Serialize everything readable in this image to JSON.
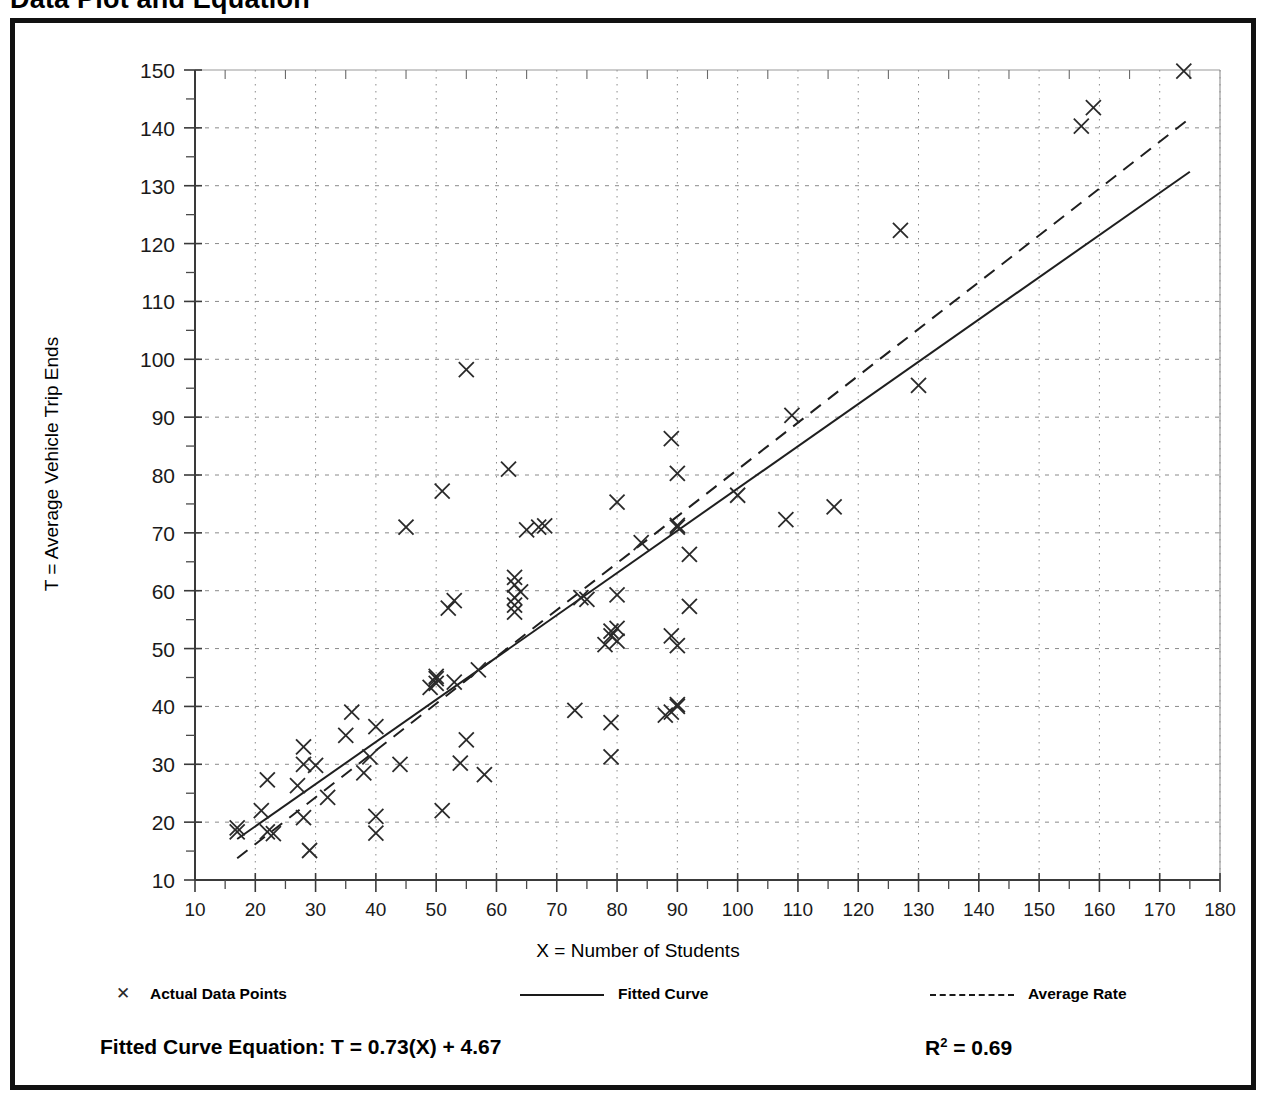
{
  "page": {
    "title": "Data Plot and Equation"
  },
  "chart_data": {
    "type": "scatter",
    "title": "Data Plot and Equation",
    "xlabel": "X = Number of Students",
    "ylabel": "T = Average Vehicle Trip Ends",
    "xlim": [
      10,
      180
    ],
    "ylim": [
      10,
      150
    ],
    "xticks": [
      10,
      20,
      30,
      40,
      50,
      60,
      70,
      80,
      90,
      100,
      110,
      120,
      130,
      140,
      150,
      160,
      170,
      180
    ],
    "yticks": [
      10,
      20,
      30,
      40,
      50,
      60,
      70,
      80,
      90,
      100,
      110,
      120,
      130,
      140,
      150
    ],
    "xtick_labels": [
      "10",
      "20",
      "30",
      "40",
      "50",
      "60",
      "70",
      "80",
      "90",
      "100",
      "110",
      "120",
      "130",
      "140",
      "150",
      "160",
      "170",
      "180"
    ],
    "ytick_labels": [
      "10",
      "20",
      "30",
      "40",
      "50",
      "60",
      "70",
      "80",
      "90",
      "100",
      "110",
      "120",
      "130",
      "140",
      "150"
    ],
    "minor_tick_step": 5,
    "grid": true,
    "grid_style": "dotted",
    "legend_position": "below-axes",
    "marker": "x",
    "series": [
      {
        "name": "Actual Data Points",
        "type": "scatter",
        "marker": "x",
        "points": [
          [
            17,
            19.0
          ],
          [
            17,
            18.3
          ],
          [
            21,
            22.0
          ],
          [
            22,
            27.3
          ],
          [
            22,
            18.3
          ],
          [
            23,
            18.0
          ],
          [
            27,
            26.3
          ],
          [
            28,
            20.8
          ],
          [
            28,
            30.0
          ],
          [
            28,
            33.0
          ],
          [
            29,
            15.1
          ],
          [
            30,
            29.8
          ],
          [
            32,
            24.3
          ],
          [
            35,
            35.0
          ],
          [
            36,
            39.0
          ],
          [
            38,
            28.5
          ],
          [
            39,
            31.3
          ],
          [
            40,
            36.5
          ],
          [
            40,
            21.0
          ],
          [
            40,
            18.1
          ],
          [
            44,
            30.0
          ],
          [
            45,
            71.0
          ],
          [
            49,
            43.3
          ],
          [
            50,
            45.2
          ],
          [
            50,
            44.8
          ],
          [
            50,
            44.0
          ],
          [
            51,
            77.2
          ],
          [
            51,
            22.0
          ],
          [
            52,
            57.0
          ],
          [
            53,
            58.3
          ],
          [
            53,
            44.2
          ],
          [
            54,
            30.2
          ],
          [
            55,
            98.2
          ],
          [
            55,
            34.2
          ],
          [
            57,
            46.3
          ],
          [
            58,
            28.2
          ],
          [
            62,
            81.0
          ],
          [
            63,
            61.0
          ],
          [
            63,
            58.8
          ],
          [
            63,
            62.3
          ],
          [
            63,
            57.5
          ],
          [
            63,
            56.3
          ],
          [
            64,
            59.8
          ],
          [
            65,
            70.5
          ],
          [
            67,
            71.0
          ],
          [
            68,
            71.2
          ],
          [
            73,
            39.3
          ],
          [
            74,
            58.8
          ],
          [
            75,
            58.5
          ],
          [
            78,
            50.7
          ],
          [
            79,
            52.2
          ],
          [
            79,
            53.0
          ],
          [
            79,
            31.3
          ],
          [
            79,
            37.2
          ],
          [
            80,
            75.3
          ],
          [
            80,
            59.3
          ],
          [
            80,
            53.5
          ],
          [
            80,
            51.3
          ],
          [
            84,
            68.3
          ],
          [
            88,
            38.5
          ],
          [
            89,
            86.3
          ],
          [
            89,
            39.0
          ],
          [
            89,
            52.2
          ],
          [
            90,
            80.3
          ],
          [
            90,
            71.3
          ],
          [
            90,
            71.0
          ],
          [
            90,
            50.5
          ],
          [
            90,
            40.3
          ],
          [
            90,
            40.0
          ],
          [
            92,
            66.3
          ],
          [
            92,
            57.3
          ],
          [
            100,
            76.5
          ],
          [
            108,
            72.3
          ],
          [
            109,
            90.3
          ],
          [
            116,
            74.5
          ],
          [
            127,
            122.3
          ],
          [
            130,
            95.5
          ],
          [
            157,
            140.3
          ],
          [
            159,
            143.5
          ],
          [
            174,
            149.8
          ]
        ]
      },
      {
        "name": "Fitted Curve",
        "type": "line",
        "style": "solid",
        "equation": "T = 0.73(X) + 4.67",
        "slope": 0.73,
        "intercept": 4.67,
        "x_range": [
          17,
          175
        ]
      },
      {
        "name": "Average Rate",
        "type": "line",
        "style": "dashed",
        "slope": 0.8095,
        "intercept": 0.0,
        "x_range": [
          17,
          175
        ]
      }
    ]
  },
  "legend": {
    "items": [
      {
        "label": "Actual Data Points",
        "marker": "x-marker-icon"
      },
      {
        "label": "Fitted Curve",
        "marker": "solid-line-icon"
      },
      {
        "label": "Average Rate",
        "marker": "dashed-line-icon"
      }
    ]
  },
  "footer": {
    "equation_label": "Fitted Curve Equation:  T = 0.73(X) + 4.67",
    "r_squared_prefix": "R",
    "r_squared_sup": "2",
    "r_squared_value": " = 0.69"
  }
}
